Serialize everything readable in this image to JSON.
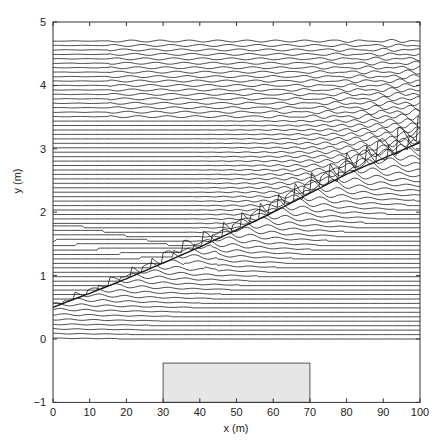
{
  "chart_data": {
    "type": "line",
    "title": "",
    "xlabel": "x (m)",
    "ylabel": "y (m)",
    "xlim": [
      0,
      100
    ],
    "ylim": [
      -1,
      5
    ],
    "xticks": [
      0,
      10,
      20,
      30,
      40,
      50,
      60,
      70,
      80,
      90,
      100
    ],
    "yticks": [
      -1,
      0,
      1,
      2,
      3,
      4,
      5
    ],
    "grid": false,
    "legend": null,
    "traces": {
      "y_start": 0.0,
      "y_end": 4.7,
      "count": 68
    },
    "wave_front": {
      "x": [
        0,
        10,
        20,
        30,
        40,
        50,
        60,
        70,
        80,
        90,
        100
      ],
      "y": [
        0.5,
        0.72,
        0.95,
        1.2,
        1.45,
        1.72,
        2.0,
        2.3,
        2.6,
        2.85,
        3.1
      ]
    },
    "annotations": [
      {
        "type": "rectangle",
        "x": [
          30,
          70
        ],
        "y": [
          -1,
          -0.38
        ],
        "fill": "#e8e8e8",
        "label": "obstacle"
      }
    ]
  },
  "colors": {
    "line": "#1a1a1a",
    "axis": "#333333",
    "rect_fill": "#e6e6e6",
    "rect_stroke": "#555555"
  }
}
